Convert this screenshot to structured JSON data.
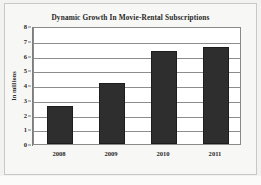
{
  "chart_data": {
    "type": "bar",
    "title": "Dynamic Growth In Movie-Rental Subscriptions",
    "xlabel": "",
    "ylabel": "In millions",
    "categories": [
      "2008",
      "2009",
      "2010",
      "2011"
    ],
    "values": [
      2.55,
      4.15,
      6.3,
      6.6
    ],
    "ylim": [
      0,
      8
    ],
    "ytick_values": [
      0,
      1,
      2,
      3,
      4,
      5,
      6,
      7,
      8
    ],
    "ytick_labels": [
      "0",
      "1",
      "2",
      "3",
      "4",
      "5",
      "6",
      "7",
      "8"
    ],
    "grid": "horizontal",
    "legend": "none",
    "series": [
      {
        "name": "Movie-rental subscriptions",
        "values": [
          2.55,
          4.15,
          6.3,
          6.6
        ]
      }
    ],
    "colors": {
      "bar": "#2e2e2e",
      "bar_edge": "#1d1d1d",
      "gridline": "#8d8d8d",
      "axis": "#7d7d7d",
      "plot_background": "#ffffff",
      "figure_background": "#f7f7f5",
      "text": "#2b2b2b"
    }
  }
}
